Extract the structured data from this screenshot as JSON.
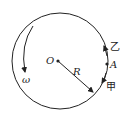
{
  "diagram": {
    "type": "circular-motion",
    "labels": {
      "center": "O",
      "radius": "R",
      "point": "A",
      "angular_velocity": "ω",
      "object_upper": "乙",
      "object_lower": "甲"
    },
    "colors": {
      "stroke": "#222222",
      "background": "#ffffff"
    }
  }
}
